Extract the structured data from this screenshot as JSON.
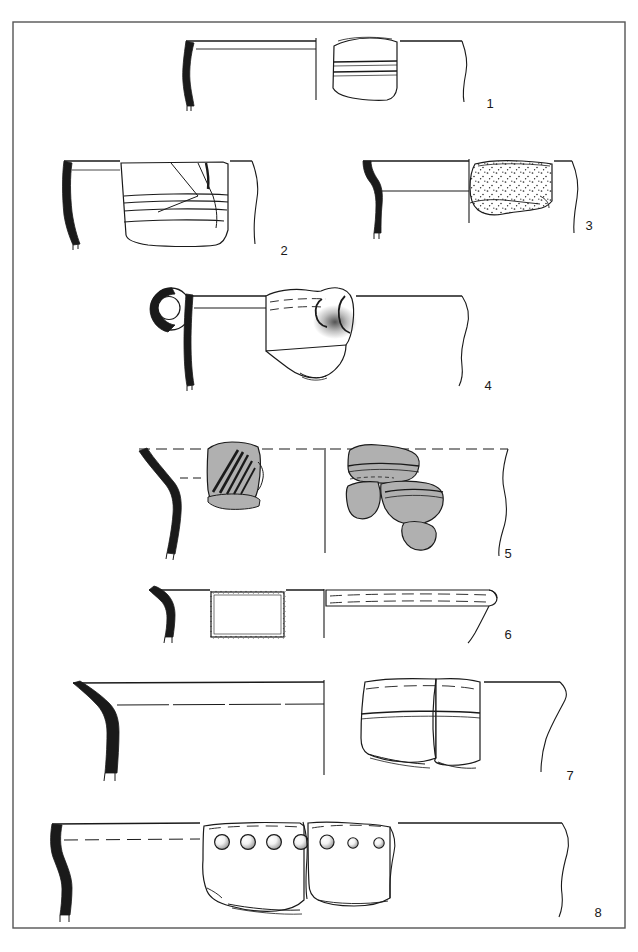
{
  "plate": {
    "type": "archaeological-pottery-illustration",
    "description": "Plate of eight ceramic vessel rim profile drawings with sherd exterior views",
    "background_color": "#ffffff",
    "ink_color": "#1a1a1a",
    "shaded_fill_color": "#b0b0b0",
    "frame": {
      "name": "plate-border",
      "x": 13,
      "y": 22,
      "width": 612,
      "height": 906,
      "stroke": "#555555",
      "stroke_width": 1.4
    },
    "figures": [
      {
        "number": "1",
        "label_x": 490,
        "label_y": 103,
        "rim_y": 40,
        "section_black": true,
        "has_handle": false,
        "sherd_style": "banded",
        "band_count": 2,
        "perforations": 0,
        "shaded": false
      },
      {
        "number": "2",
        "label_x": 284,
        "label_y": 250,
        "rim_y": 160,
        "section_black": true,
        "has_handle": false,
        "sherd_style": "banded",
        "band_count": 4,
        "perforations": 0,
        "shaded": false
      },
      {
        "number": "3",
        "label_x": 589,
        "label_y": 225,
        "rim_y": 160,
        "section_black": true,
        "has_handle": false,
        "sherd_style": "stippled",
        "band_count": 0,
        "perforations": 0,
        "shaded": false
      },
      {
        "number": "4",
        "label_x": 488,
        "label_y": 385,
        "rim_y": 295,
        "section_black": true,
        "has_handle": true,
        "handle_type": "loop-handle",
        "sherd_style": "lug-attachment",
        "band_count": 0,
        "perforations": 0,
        "shaded": false
      },
      {
        "number": "5",
        "label_x": 508,
        "label_y": 553,
        "rim_y": 445,
        "section_black": true,
        "has_handle": false,
        "sherd_style": "incised-diagonal",
        "band_count": 2,
        "perforations": 0,
        "shaded": true
      },
      {
        "number": "6",
        "label_x": 508,
        "label_y": 634,
        "rim_y": 592,
        "section_black": true,
        "has_handle": false,
        "sherd_style": "plain-rectangular",
        "band_count": 0,
        "perforations": 0,
        "shaded": false
      },
      {
        "number": "7",
        "label_x": 570,
        "label_y": 775,
        "rim_y": 683,
        "section_black": true,
        "has_handle": false,
        "sherd_style": "banded",
        "band_count": 1,
        "perforations": 0,
        "shaded": false
      },
      {
        "number": "8",
        "label_x": 598,
        "label_y": 912,
        "rim_y": 823,
        "section_black": true,
        "has_handle": false,
        "sherd_style": "perforated",
        "band_count": 0,
        "perforations": 8,
        "shaded": false
      }
    ]
  }
}
